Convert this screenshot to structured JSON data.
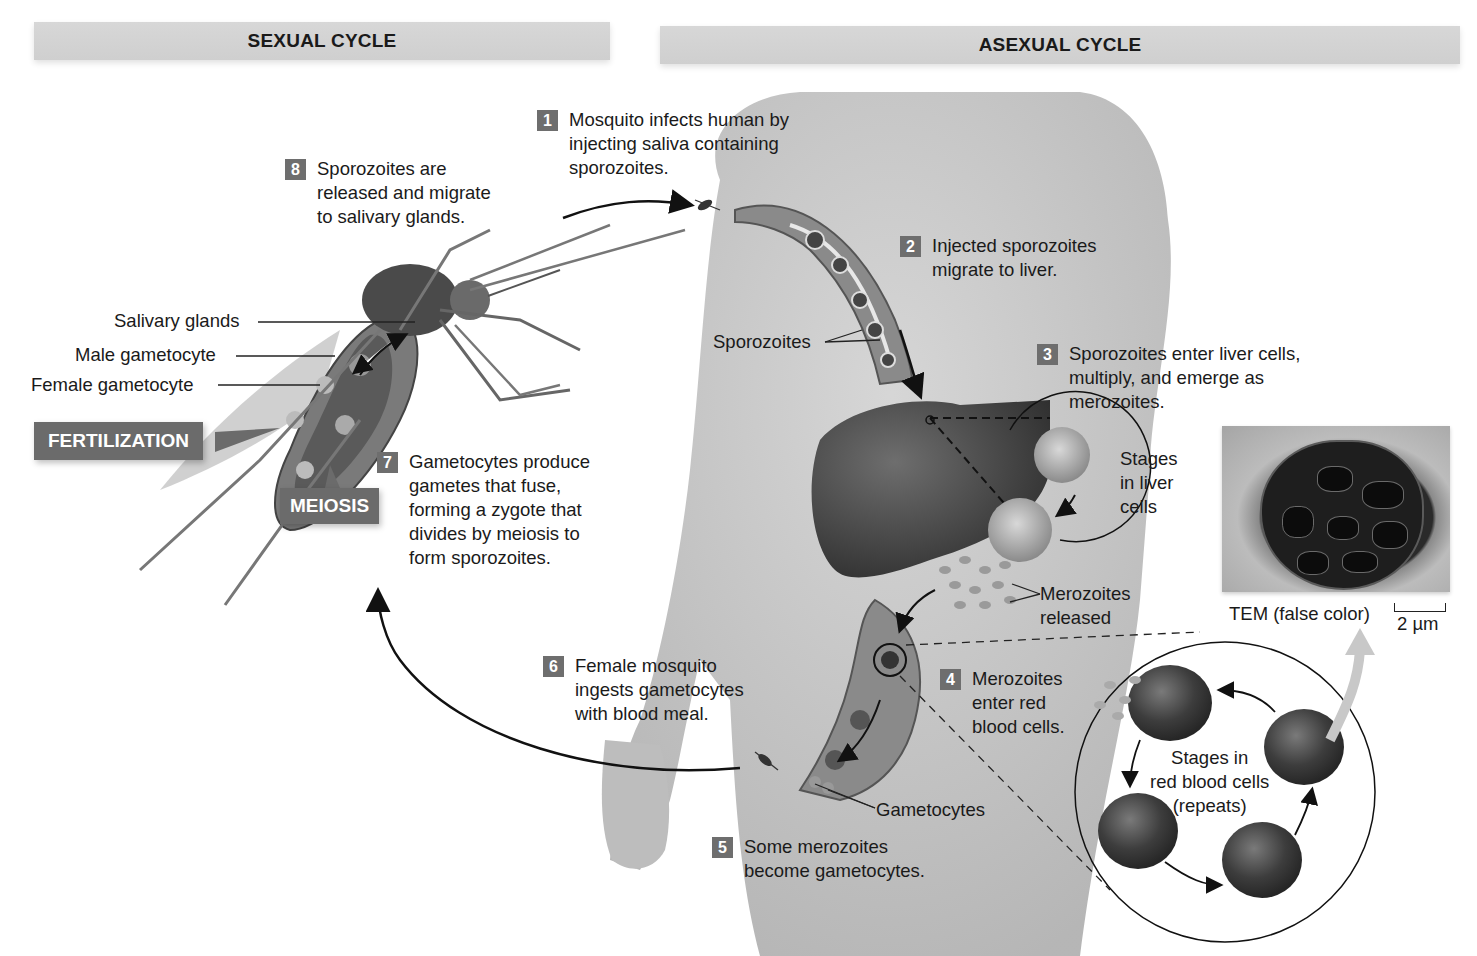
{
  "banners": {
    "sexual": "SEXUAL CYCLE",
    "asexual": "ASEXUAL CYCLE"
  },
  "steps": [
    {
      "num": "1",
      "text": "Mosquito infects human by\ninjecting saliva containing\nsporozoites."
    },
    {
      "num": "2",
      "text": "Injected sporozoites\nmigrate to liver."
    },
    {
      "num": "3",
      "text": "Sporozoites enter liver cells,\nmultiply, and emerge as\nmerozoites."
    },
    {
      "num": "4",
      "text": "Merozoites\nenter red\nblood cells."
    },
    {
      "num": "5",
      "text": "Some merozoites\nbecome gametocytes."
    },
    {
      "num": "6",
      "text": "Female mosquito\ningests gametocytes\nwith blood meal."
    },
    {
      "num": "7",
      "text": "Gametocytes produce\ngametes that fuse,\nforming a zygote that\ndivides by meiosis to\nform sporozoites."
    },
    {
      "num": "8",
      "text": "Sporozoites are\nreleased and migrate\nto salivary glands."
    }
  ],
  "mosquito_labels": {
    "salivary_glands": "Salivary glands",
    "male_gametocyte": "Male gametocyte",
    "female_gametocyte": "Female gametocyte"
  },
  "tags": {
    "fertilization": "FERTILIZATION",
    "meiosis": "MEIOSIS"
  },
  "body_labels": {
    "sporozoites": "Sporozoites",
    "stages_liver": "Stages\nin liver\ncells",
    "merozoites_released": "Merozoites\nreleased",
    "gametocytes": "Gametocytes",
    "stages_rbc": "Stages in\nred blood cells\n(repeats)"
  },
  "micrograph": {
    "caption": "TEM (false color)",
    "scale": "2 µm"
  },
  "colors": {
    "banner": "#d3d3d3",
    "step_badge": "#6e6e6e",
    "tag": "#6b6b6b",
    "text": "#1a1a1a"
  }
}
